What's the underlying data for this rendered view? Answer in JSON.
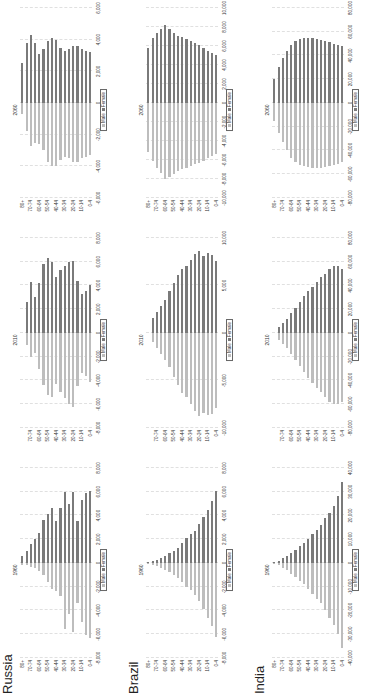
{
  "chart_data": {
    "type": "bar",
    "orientation": "horizontal",
    "age_groups": [
      "0-4",
      "5-9",
      "10-14",
      "15-19",
      "20-24",
      "25-29",
      "30-34",
      "35-39",
      "40-44",
      "45-49",
      "50-54",
      "55-59",
      "60-64",
      "65-69",
      "70-74",
      "75-79",
      "80+"
    ],
    "age_tick_labels": [
      "0-4",
      "10-14",
      "20-24",
      "30-34",
      "40-44",
      "50-54",
      "60-64",
      "70-74",
      "80+"
    ],
    "legend": [
      "Male",
      "Female"
    ],
    "colors": {
      "male": "#bdbdbd",
      "female": "#7a7a7a"
    },
    "panels": [
      {
        "country": "Russia",
        "year": "1960",
        "xlim": [
          -8000,
          8000
        ],
        "xticks": [
          "-8,000",
          "-6,000",
          "-4,000",
          "-2,000",
          "0",
          "2,000",
          "4,000",
          "6,000",
          "8,000"
        ],
        "male": [
          6300,
          6100,
          5000,
          3400,
          5800,
          4300,
          5600,
          2800,
          2400,
          2200,
          1600,
          1000,
          700,
          400,
          300,
          200,
          150
        ],
        "female": [
          6100,
          5900,
          5300,
          3500,
          6000,
          5000,
          6000,
          4600,
          3500,
          4600,
          4100,
          3600,
          2500,
          2000,
          1600,
          1000,
          600
        ]
      },
      {
        "country": "Russia",
        "year": "2010",
        "xlim": [
          -8000,
          8000
        ],
        "xticks": [
          "-8,000",
          "-6,000",
          "-4,000",
          "-2,000",
          "0",
          "2,000",
          "4,000",
          "6,000",
          "8,000"
        ],
        "male": [
          4100,
          3600,
          3400,
          4500,
          6200,
          6000,
          5500,
          5000,
          4300,
          5400,
          5200,
          4400,
          3000,
          1700,
          2000,
          1000
        ],
        "female": [
          4000,
          3500,
          3300,
          4400,
          6100,
          6000,
          5600,
          5300,
          4700,
          6000,
          6300,
          5800,
          4200,
          3000,
          4300,
          2600
        ]
      },
      {
        "country": "Russia",
        "year": "2060",
        "xlim": [
          -6000,
          6000
        ],
        "xticks": [
          "-6,000",
          "-4,000",
          "-2,000",
          "0",
          "2,000",
          "4,000",
          "6,000"
        ],
        "male": [
          3300,
          3400,
          3500,
          3700,
          3700,
          3500,
          3400,
          3600,
          4000,
          4000,
          3700,
          3000,
          2600,
          2500,
          2700,
          1800,
          700
        ],
        "female": [
          3200,
          3300,
          3400,
          3600,
          3600,
          3400,
          3300,
          3500,
          4000,
          4100,
          3900,
          3400,
          3100,
          3800,
          4300,
          3800,
          2500
        ]
      },
      {
        "country": "Brazil",
        "year": "1960",
        "xlim": [
          -8000,
          8000
        ],
        "xticks": [
          "-8,000",
          "-6,000",
          "-4,000",
          "-2,000",
          "0",
          "2,000",
          "4,000",
          "6,000",
          "8,000"
        ],
        "male": [
          6200,
          5300,
          4600,
          3900,
          3200,
          2700,
          2300,
          2000,
          1600,
          1300,
          1000,
          800,
          600,
          400,
          250,
          150,
          80
        ],
        "female": [
          6100,
          5200,
          4500,
          3900,
          3300,
          2700,
          2400,
          2100,
          1700,
          1300,
          1000,
          800,
          600,
          400,
          250,
          150,
          100
        ]
      },
      {
        "country": "Brazil",
        "year": "2010",
        "xlim": [
          -10000,
          10000
        ],
        "xticks": [
          "-10,000",
          "-5,000",
          "0",
          "5,000",
          "10,000"
        ],
        "male": [
          7900,
          8500,
          8600,
          8400,
          8700,
          8200,
          7500,
          6700,
          6300,
          5500,
          4600,
          3600,
          2800,
          2200,
          1600,
          1000
        ],
        "female": [
          7600,
          8200,
          8400,
          8100,
          8600,
          8300,
          7700,
          7000,
          6700,
          6100,
          5300,
          4400,
          3500,
          2800,
          2200,
          1600
        ]
      },
      {
        "country": "Brazil",
        "year": "2060",
        "xlim": [
          -10000,
          10000
        ],
        "xticks": [
          "-10,000",
          "-8,000",
          "-6,000",
          "-4,000",
          "-2,000",
          "0",
          "2,000",
          "4,000",
          "6,000",
          "8,000",
          "10,000"
        ],
        "male": [
          5400,
          5600,
          5800,
          6100,
          6300,
          6400,
          6600,
          6800,
          7000,
          7200,
          7500,
          7800,
          8000,
          7400,
          6800,
          6100,
          5200
        ],
        "female": [
          5100,
          5300,
          5500,
          5800,
          6100,
          6300,
          6500,
          6700,
          6900,
          7100,
          7400,
          7800,
          8200,
          7800,
          7400,
          6800,
          5800
        ]
      },
      {
        "country": "India",
        "year": "1960",
        "xlim": [
          -40000,
          40000
        ],
        "xticks": [
          "-40,000",
          "-30,000",
          "-20,000",
          "-10,000",
          "0",
          "10,000",
          "20,000",
          "30,000",
          "40,000"
        ],
        "male": [
          36000,
          30000,
          26000,
          23000,
          20000,
          17000,
          15000,
          13000,
          11000,
          9000,
          7500,
          6000,
          4500,
          3000,
          2000,
          1000,
          500
        ],
        "female": [
          34000,
          28000,
          24000,
          21000,
          19000,
          16000,
          14000,
          12000,
          10000,
          8500,
          7000,
          5500,
          4200,
          3000,
          2000,
          1000,
          500
        ]
      },
      {
        "country": "India",
        "year": "2010",
        "xlim": [
          -80000,
          80000
        ],
        "xticks": [
          "-80,000",
          "-60,000",
          "-40,000",
          "-20,000",
          "0",
          "20,000",
          "40,000",
          "60,000",
          "80,000"
        ],
        "male": [
          58000,
          60000,
          60000,
          58000,
          54000,
          50000,
          46000,
          42000,
          38000,
          33000,
          28000,
          23000,
          18000,
          13000,
          9000,
          6000
        ],
        "female": [
          54000,
          56000,
          56000,
          54000,
          50000,
          47000,
          43000,
          39000,
          35000,
          31000,
          26000,
          21000,
          17000,
          12000,
          8000,
          5000
        ]
      },
      {
        "country": "India",
        "year": "2060",
        "xlim": [
          -80000,
          80000
        ],
        "xticks": [
          "-80,000",
          "-60,000",
          "-40,000",
          "-20,000",
          "0",
          "20,000",
          "40,000",
          "60,000",
          "80,000"
        ],
        "male": [
          50000,
          51000,
          52000,
          53000,
          54000,
          55000,
          55000,
          55000,
          54000,
          53000,
          52000,
          50000,
          46000,
          40000,
          33000,
          25000,
          15000
        ],
        "female": [
          48000,
          49000,
          50000,
          51000,
          52000,
          53000,
          54000,
          55000,
          55000,
          55000,
          54000,
          52000,
          49000,
          44000,
          38000,
          30000,
          20000
        ]
      }
    ]
  },
  "rows": [
    {
      "country": "Russia"
    },
    {
      "country": "Brazil"
    },
    {
      "country": "India"
    }
  ],
  "legend": {
    "male": "Male",
    "female": "Female"
  }
}
